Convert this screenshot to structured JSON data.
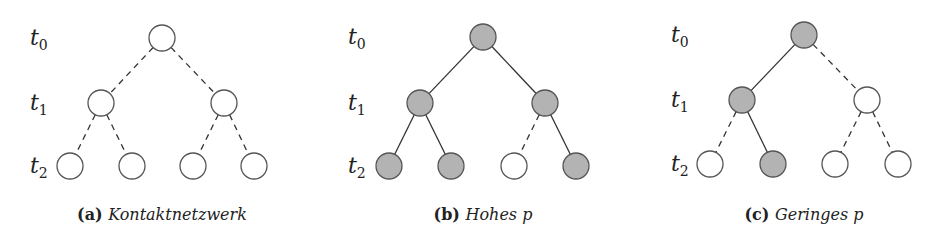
{
  "colors": {
    "filled": "#b3b3b3",
    "empty": "#ffffff",
    "stroke": "#555555"
  },
  "level_labels": [
    {
      "base": "t",
      "sub": "0"
    },
    {
      "base": "t",
      "sub": "1"
    },
    {
      "base": "t",
      "sub": "2"
    }
  ],
  "panels": [
    {
      "id": "a",
      "caption_tag": "(a)",
      "caption_text": "Kontaktnetzwerk",
      "label_x": 30,
      "nodes": [
        {
          "x": 162,
          "y": 38,
          "filled": false
        },
        {
          "x": 101,
          "y": 103,
          "filled": false
        },
        {
          "x": 224,
          "y": 103,
          "filled": false
        },
        {
          "x": 70,
          "y": 166,
          "filled": false
        },
        {
          "x": 132,
          "y": 166,
          "filled": false
        },
        {
          "x": 193,
          "y": 166,
          "filled": false
        },
        {
          "x": 254,
          "y": 166,
          "filled": false
        }
      ],
      "edges": [
        {
          "from": 0,
          "to": 1,
          "active": false
        },
        {
          "from": 0,
          "to": 2,
          "active": false
        },
        {
          "from": 1,
          "to": 3,
          "active": false
        },
        {
          "from": 1,
          "to": 4,
          "active": false
        },
        {
          "from": 2,
          "to": 5,
          "active": false
        },
        {
          "from": 2,
          "to": 6,
          "active": false
        }
      ],
      "caption_x": 162
    },
    {
      "id": "b",
      "caption_tag": "(b)",
      "caption_text": "Hohes p",
      "label_x": 348,
      "nodes": [
        {
          "x": 483,
          "y": 37,
          "filled": true
        },
        {
          "x": 420,
          "y": 103,
          "filled": true
        },
        {
          "x": 545,
          "y": 103,
          "filled": true
        },
        {
          "x": 389,
          "y": 166,
          "filled": true
        },
        {
          "x": 451,
          "y": 166,
          "filled": true
        },
        {
          "x": 514,
          "y": 166,
          "filled": false
        },
        {
          "x": 576,
          "y": 166,
          "filled": true
        }
      ],
      "edges": [
        {
          "from": 0,
          "to": 1,
          "active": true
        },
        {
          "from": 0,
          "to": 2,
          "active": true
        },
        {
          "from": 1,
          "to": 3,
          "active": true
        },
        {
          "from": 1,
          "to": 4,
          "active": true
        },
        {
          "from": 2,
          "to": 5,
          "active": false
        },
        {
          "from": 2,
          "to": 6,
          "active": true
        }
      ],
      "caption_x": 483
    },
    {
      "id": "c",
      "caption_tag": "(c)",
      "caption_text": "Geringes p",
      "label_x": 671,
      "nodes": [
        {
          "x": 804,
          "y": 35,
          "filled": true
        },
        {
          "x": 742,
          "y": 100,
          "filled": true
        },
        {
          "x": 867,
          "y": 100,
          "filled": false
        },
        {
          "x": 710,
          "y": 164,
          "filled": false
        },
        {
          "x": 773,
          "y": 164,
          "filled": true
        },
        {
          "x": 835,
          "y": 164,
          "filled": false
        },
        {
          "x": 898,
          "y": 164,
          "filled": false
        }
      ],
      "edges": [
        {
          "from": 0,
          "to": 1,
          "active": true
        },
        {
          "from": 0,
          "to": 2,
          "active": false
        },
        {
          "from": 1,
          "to": 3,
          "active": false
        },
        {
          "from": 1,
          "to": 4,
          "active": true
        },
        {
          "from": 2,
          "to": 5,
          "active": false
        },
        {
          "from": 2,
          "to": 6,
          "active": false
        }
      ],
      "caption_x": 804
    }
  ]
}
